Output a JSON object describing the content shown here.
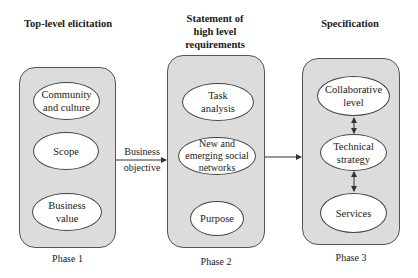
{
  "headings": {
    "phase1": "Top-level elicitation",
    "phase2": "Statement of\nhigh level\nrequirements",
    "phase3": "Specification"
  },
  "phases": [
    {
      "label": "Phase 1",
      "nodes": [
        "Community\nand culture",
        "Scope",
        "Business\nvalue"
      ]
    },
    {
      "label": "Phase 2",
      "nodes": [
        "Task\nanalysis",
        "New and\nemerging social\nnetworks",
        "Purpose"
      ]
    },
    {
      "label": "Phase 3",
      "nodes": [
        "Collaborative\nlevel",
        "Technical\nstrategy",
        "Services"
      ]
    }
  ],
  "edges": [
    {
      "from": "Phase 1",
      "to": "Phase 2",
      "label_top": "Business",
      "label_bottom": "objective",
      "type": "arrow"
    },
    {
      "from": "Phase 2",
      "to": "Phase 3",
      "label_top": "",
      "label_bottom": "",
      "type": "arrow"
    },
    {
      "from": "Collaborative level",
      "to": "Technical strategy",
      "type": "bidirectional"
    },
    {
      "from": "Technical strategy",
      "to": "Services",
      "type": "bidirectional"
    }
  ],
  "colors": {
    "box_fill": "#dcdcdc",
    "node_fill": "#ffffff",
    "stroke": "#444444"
  }
}
